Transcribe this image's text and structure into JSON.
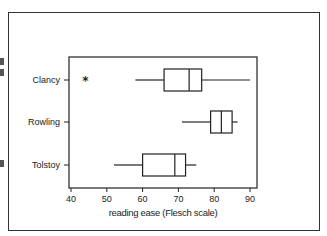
{
  "chart_data": {
    "type": "boxplot",
    "orientation": "horizontal",
    "title": "",
    "xlabel": "reading ease (Flesch scale)",
    "ylabel": "",
    "xlim": [
      40,
      90
    ],
    "xticks": [
      40,
      50,
      60,
      70,
      80,
      90
    ],
    "categories": [
      "Clancy",
      "Rowling",
      "Tolstoy"
    ],
    "series": [
      {
        "name": "Clancy",
        "whisker_low": 58,
        "q1": 66,
        "median": 73,
        "q3": 76.5,
        "whisker_high": 90,
        "outliers": [
          44
        ]
      },
      {
        "name": "Rowling",
        "whisker_low": 71,
        "q1": 79,
        "median": 82,
        "q3": 85,
        "whisker_high": 86.5,
        "outliers": []
      },
      {
        "name": "Tolstoy",
        "whisker_low": 52,
        "q1": 60,
        "median": 69,
        "q3": 72,
        "whisker_high": 75,
        "outliers": []
      }
    ],
    "grid": false,
    "legend": "none"
  },
  "colors": {
    "line": "#222222",
    "background": "#ffffff"
  }
}
